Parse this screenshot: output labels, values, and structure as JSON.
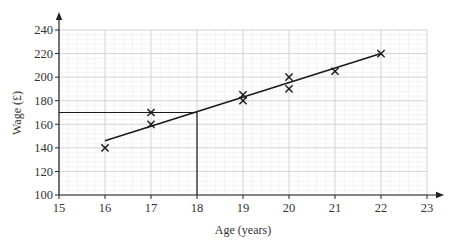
{
  "chart_data": {
    "type": "scatter",
    "title": "",
    "xlabel": "Age (years)",
    "ylabel": "Wage (£)",
    "xlim": [
      15,
      23
    ],
    "ylim": [
      100,
      240
    ],
    "x_ticks": [
      15,
      16,
      17,
      18,
      19,
      20,
      21,
      22,
      23
    ],
    "y_ticks": [
      100,
      120,
      140,
      160,
      180,
      200,
      220,
      240
    ],
    "grid": true,
    "minor_grid": true,
    "legend": null,
    "series": [
      {
        "name": "data",
        "marker": "x",
        "points": [
          {
            "x": 16,
            "y": 140
          },
          {
            "x": 17,
            "y": 160
          },
          {
            "x": 17,
            "y": 170
          },
          {
            "x": 19,
            "y": 180
          },
          {
            "x": 19,
            "y": 185
          },
          {
            "x": 20,
            "y": 190
          },
          {
            "x": 20,
            "y": 200
          },
          {
            "x": 21,
            "y": 205
          },
          {
            "x": 22,
            "y": 220
          }
        ]
      }
    ],
    "line_of_best_fit": {
      "x1": 16,
      "y1": 146,
      "x2": 22,
      "y2": 220
    },
    "annotations": [
      {
        "type": "reading_line",
        "description": "Vertical line from x=18 up to the best-fit line, then horizontal to the y-axis",
        "x": 18,
        "y": 170
      }
    ]
  },
  "colors": {
    "axis": "#222222",
    "major_grid": "#cfcfcf",
    "minor_grid": "#ebebeb",
    "ink": "#1a1a1a",
    "text": "#333333"
  }
}
